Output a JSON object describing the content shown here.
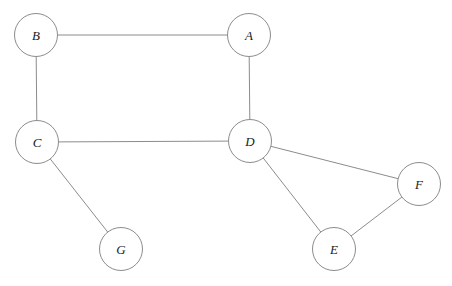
{
  "diagram": {
    "type": "node-link-graph",
    "width": 452,
    "height": 286,
    "background_color": "#ffffff",
    "stroke_color": "#8c8c8c",
    "label_color": "#1a1a1a",
    "node_radius": 21.5,
    "nodes": [
      {
        "id": "A",
        "label": "A",
        "cx": 249,
        "cy": 35
      },
      {
        "id": "B",
        "label": "B",
        "cx": 36,
        "cy": 35
      },
      {
        "id": "C",
        "label": "C",
        "cx": 37,
        "cy": 142
      },
      {
        "id": "D",
        "label": "D",
        "cx": 250,
        "cy": 141
      },
      {
        "id": "E",
        "label": "E",
        "cx": 334,
        "cy": 249
      },
      {
        "id": "F",
        "label": "F",
        "cx": 419,
        "cy": 184
      },
      {
        "id": "G",
        "label": "G",
        "cx": 121,
        "cy": 249
      }
    ],
    "edges": [
      {
        "id": "B-A",
        "from": "B",
        "to": "A"
      },
      {
        "id": "B-C",
        "from": "B",
        "to": "C"
      },
      {
        "id": "A-D",
        "from": "A",
        "to": "D"
      },
      {
        "id": "C-D",
        "from": "C",
        "to": "D"
      },
      {
        "id": "C-G",
        "from": "C",
        "to": "G"
      },
      {
        "id": "D-F",
        "from": "D",
        "to": "F"
      },
      {
        "id": "D-E",
        "from": "D",
        "to": "E"
      },
      {
        "id": "E-F",
        "from": "E",
        "to": "F"
      }
    ]
  }
}
